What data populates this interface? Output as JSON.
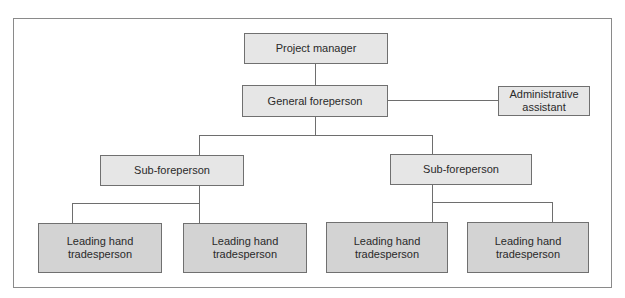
{
  "diagram": {
    "type": "org-chart",
    "nodes": {
      "project_manager": "Project manager",
      "general_foreperson": "General foreperson",
      "administrative_assistant": "Administrative\nassistant",
      "sub_foreperson_left": "Sub-foreperson",
      "sub_foreperson_right": "Sub-foreperson",
      "leading_hand_1": "Leading hand\ntradesperson",
      "leading_hand_2": "Leading hand\ntradesperson",
      "leading_hand_3": "Leading hand\ntradesperson",
      "leading_hand_4": "Leading hand\ntradesperson"
    },
    "edges": [
      [
        "project_manager",
        "general_foreperson"
      ],
      [
        "general_foreperson",
        "administrative_assistant"
      ],
      [
        "general_foreperson",
        "sub_foreperson_left"
      ],
      [
        "general_foreperson",
        "sub_foreperson_right"
      ],
      [
        "sub_foreperson_left",
        "leading_hand_1"
      ],
      [
        "sub_foreperson_left",
        "leading_hand_2"
      ],
      [
        "sub_foreperson_right",
        "leading_hand_3"
      ],
      [
        "sub_foreperson_right",
        "leading_hand_4"
      ]
    ],
    "colors": {
      "box_light": "#e6e6e6",
      "box_dark": "#d3d3d3",
      "border": "#707070",
      "line": "#6e6e6e"
    }
  }
}
